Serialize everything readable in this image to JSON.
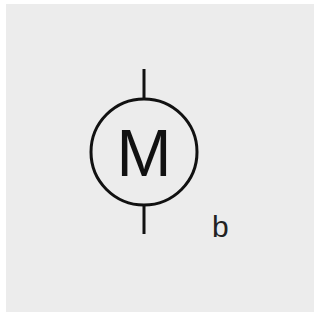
{
  "diagram": {
    "symbol": "motor",
    "circle_label": "M",
    "caption": "b",
    "colors": {
      "background": "#ececec",
      "stroke": "#111111",
      "border": "#ffffff"
    }
  }
}
